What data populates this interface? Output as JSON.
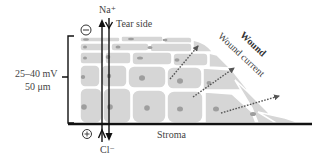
{
  "diagram": {
    "labels": {
      "sodium": "Na⁺",
      "chloride": "Cl⁻",
      "tear_side": "Tear side",
      "stroma": "Stroma",
      "voltage": "25–40 mV",
      "thickness": "50 μm",
      "wound": "Wound",
      "wound_current": "Wound current",
      "negative_sign": "−",
      "positive_sign": "+"
    },
    "colors": {
      "cell_fill": "#d6d6d6",
      "cell_border": "#ffffff",
      "nucleus": "#9e9e9e",
      "line": "#111111",
      "dotted_arrow": "#555555",
      "text": "#444444"
    },
    "icons": [
      "minus-circle-icon",
      "plus-circle-icon",
      "arrow-up-icon",
      "arrow-down-icon",
      "dotted-arrow-icon"
    ]
  }
}
